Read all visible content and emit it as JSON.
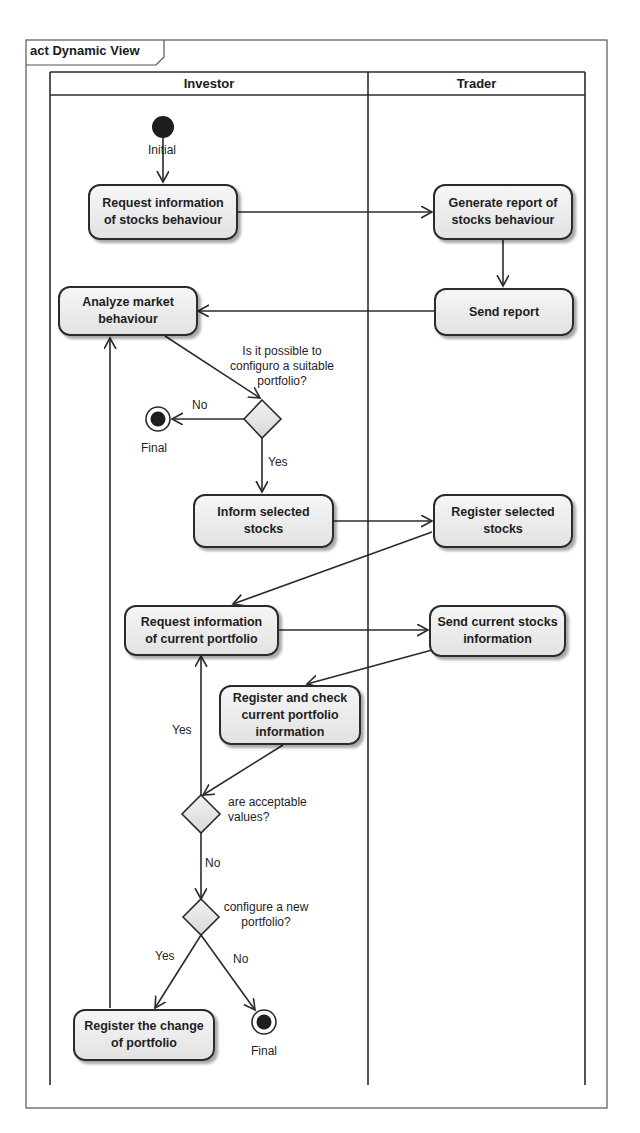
{
  "frame": {
    "title": "act Dynamic View"
  },
  "lanes": [
    {
      "name": "Investor"
    },
    {
      "name": "Trader"
    }
  ],
  "nodes": {
    "initial": {
      "label": "Initial"
    },
    "request_stocks_info": {
      "line1": "Request information",
      "line2": "of stocks behaviour"
    },
    "generate_report": {
      "line1": "Generate report of",
      "line2": "stocks behaviour"
    },
    "send_report": {
      "line1": "Send report"
    },
    "analyze_market": {
      "line1": "Analyze market",
      "line2": "behaviour"
    },
    "decision_portfolio": {
      "line1": "Is it possible to",
      "line2": "configuro a suitable",
      "line3": "portfolio?"
    },
    "final_1": {
      "label": "Final"
    },
    "inform_selected": {
      "line1": "Inform selected",
      "line2": "stocks"
    },
    "register_selected": {
      "line1": "Register selected",
      "line2": "stocks"
    },
    "request_current_portfolio": {
      "line1": "Request information",
      "line2": "of current portfolio"
    },
    "send_current_stocks": {
      "line1": "Send current stocks",
      "line2": "information"
    },
    "register_check": {
      "line1": "Register and check",
      "line2": "current portfolio",
      "line3": "information"
    },
    "decision_acceptable": {
      "line1": "are acceptable",
      "line2": "values?"
    },
    "decision_new_portfolio": {
      "line1": "configure a new",
      "line2": "portfolio?"
    },
    "register_change": {
      "line1": "Register the change",
      "line2": "of portfolio"
    },
    "final_2": {
      "label": "Final"
    }
  },
  "guards": {
    "portfolio_no": "No",
    "portfolio_yes": "Yes",
    "acceptable_yes": "Yes",
    "acceptable_no": "No",
    "new_portfolio_yes": "Yes",
    "new_portfolio_no": "No"
  }
}
